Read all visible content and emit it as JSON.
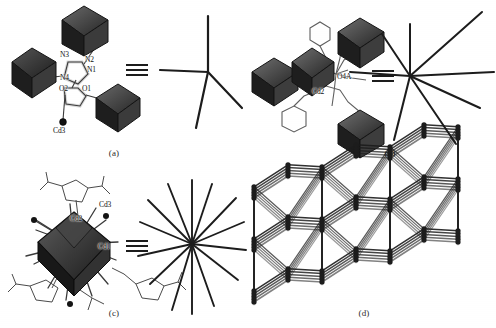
{
  "figure": {
    "background_color": "#ffffff",
    "ink_color": "#1c1c1c",
    "polyhedron_dark": "#2b2b2b",
    "polyhedron_mid": "#5a5a5a",
    "polyhedron_light": "#8a8a8a",
    "panels": [
      {
        "id": "a",
        "caption": "(a)",
        "description": "Coordination mode of ligand with three polyhedra, simplified as a 4-connected node",
        "atom_labels": [
          {
            "text": "N3",
            "x": 60,
            "y": 56
          },
          {
            "text": "N2",
            "x": 85,
            "y": 61
          },
          {
            "text": "N1",
            "x": 87,
            "y": 71
          },
          {
            "text": "N4",
            "x": 63,
            "y": 79
          },
          {
            "text": "O2",
            "x": 62,
            "y": 90
          },
          {
            "text": "O1",
            "x": 84,
            "y": 90
          },
          {
            "text": "Cd3",
            "x": 55,
            "y": 128
          }
        ],
        "node_connectivity": 4
      },
      {
        "id": "b",
        "caption": "(b)",
        "description": "Cd2 centre linking four polyhedra with phenyl rings, simplified as an 8-connected node",
        "atom_labels": [
          {
            "text": "O4A",
            "x": 337,
            "y": 78
          },
          {
            "text": "Cd2",
            "x": 313,
            "y": 93
          }
        ],
        "node_connectivity": 8
      },
      {
        "id": "c",
        "caption": "(c)",
        "description": "Cd1/Cd2/Cd3 cluster core with surrounding ligands, simplified as a high-connectivity node",
        "atom_labels": [
          {
            "text": "Cd3",
            "x": 101,
            "y": 203
          },
          {
            "text": "Cd2",
            "x": 72,
            "y": 218
          },
          {
            "text": "Cd1",
            "x": 100,
            "y": 245
          }
        ],
        "node_connectivity": 14
      },
      {
        "id": "d",
        "caption": "(d)",
        "description": "Extended 3D topological network built from the simplified nodes",
        "atom_labels": [],
        "node_connectivity": 0
      }
    ]
  }
}
